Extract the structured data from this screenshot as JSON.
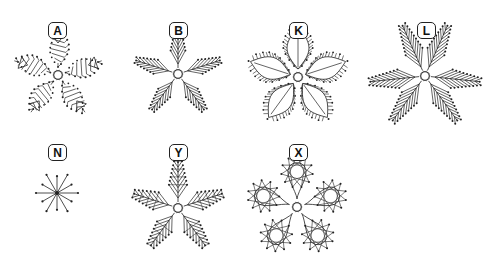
{
  "figure": {
    "background": "#ffffff",
    "stroke_color": "#222222",
    "panels": [
      {
        "label": "A",
        "label_pos": [
          57,
          30
        ],
        "center": [
          58,
          75
        ],
        "arms": 5,
        "style": "loop-net",
        "radius": 40,
        "rotation": -90
      },
      {
        "label": "B",
        "label_pos": [
          178,
          30
        ],
        "center": [
          178,
          74
        ],
        "arms": 5,
        "style": "fan-comb",
        "radius": 44,
        "rotation": -90
      },
      {
        "label": "K",
        "label_pos": [
          298,
          30
        ],
        "center": [
          298,
          77
        ],
        "arms": 5,
        "style": "leaf",
        "radius": 50,
        "rotation": -90
      },
      {
        "label": "L",
        "label_pos": [
          426,
          30
        ],
        "center": [
          425,
          76
        ],
        "arms": 3,
        "style": "double-fan",
        "radius": 55,
        "rotation": -90
      },
      {
        "label": "N",
        "label_pos": [
          57,
          152
        ],
        "center": [
          57,
          193
        ],
        "arms": 12,
        "style": "star",
        "radius": 21,
        "rotation": 0
      },
      {
        "label": "Y",
        "label_pos": [
          178,
          152
        ],
        "center": [
          178,
          208
        ],
        "arms": 5,
        "style": "fan-cross",
        "radius": 46,
        "rotation": -90
      },
      {
        "label": "X",
        "label_pos": [
          298,
          152
        ],
        "center": [
          297,
          207
        ],
        "arms": 5,
        "style": "petal-star",
        "radius": 44,
        "rotation": -90
      }
    ]
  }
}
